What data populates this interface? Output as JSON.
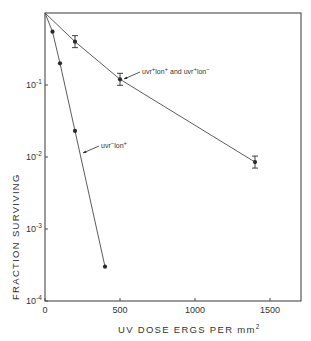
{
  "chart_data": {
    "type": "line",
    "title": "",
    "xlabel": "UV DOSE ERGS PER mm²",
    "xlabel_parts": {
      "main": "UV  DOSE  ERGS  PER  mm",
      "sup": "2"
    },
    "ylabel": "FRACTION SURVIVING",
    "yscale": "log",
    "xlim": [
      0,
      1700
    ],
    "ylim": [
      0.0001,
      1
    ],
    "x_ticks": [
      0,
      500,
      1000,
      1500
    ],
    "x_tick_labels": [
      "0",
      "500",
      "1000",
      "1500"
    ],
    "y_ticks": [
      0.1,
      0.01,
      0.001,
      0.0001
    ],
    "y_tick_labels": [
      {
        "base": "10",
        "exp": "-1"
      },
      {
        "base": "10",
        "exp": "-2"
      },
      {
        "base": "10",
        "exp": "-3"
      },
      {
        "base": "10",
        "exp": "-4"
      }
    ],
    "grid": false,
    "legend": null,
    "series": [
      {
        "name": "uvr+ lon+ and uvr+ lon-",
        "label_parts": [
          "uvr",
          "+",
          "lon",
          "+",
          " and  uvr",
          "+",
          "lon",
          "-"
        ],
        "x": [
          0,
          200,
          500,
          1400
        ],
        "y": [
          1.0,
          0.4,
          0.12,
          0.0085
        ],
        "error_bars": [
          false,
          true,
          true,
          true
        ],
        "marker": "filled-circle"
      },
      {
        "name": "uvr- lon+",
        "label_parts": [
          "uvr",
          "-",
          "lon",
          "+"
        ],
        "x": [
          0,
          50,
          100,
          200,
          400
        ],
        "y": [
          1.0,
          0.55,
          0.2,
          0.023,
          0.0003
        ],
        "error_bars": [
          false,
          false,
          false,
          false,
          false
        ],
        "marker": "filled-circle"
      }
    ],
    "annotations": [
      {
        "text": "uvr+ lon+ and uvr+ lon-",
        "points_to_series": 0,
        "near_x": 500
      },
      {
        "text": "uvr- lon+",
        "points_to_series": 1,
        "near_x": 200
      }
    ]
  },
  "colors": {
    "ink": "#2a2a2a",
    "line": "#4a4a4a",
    "background": "#ffffff"
  }
}
